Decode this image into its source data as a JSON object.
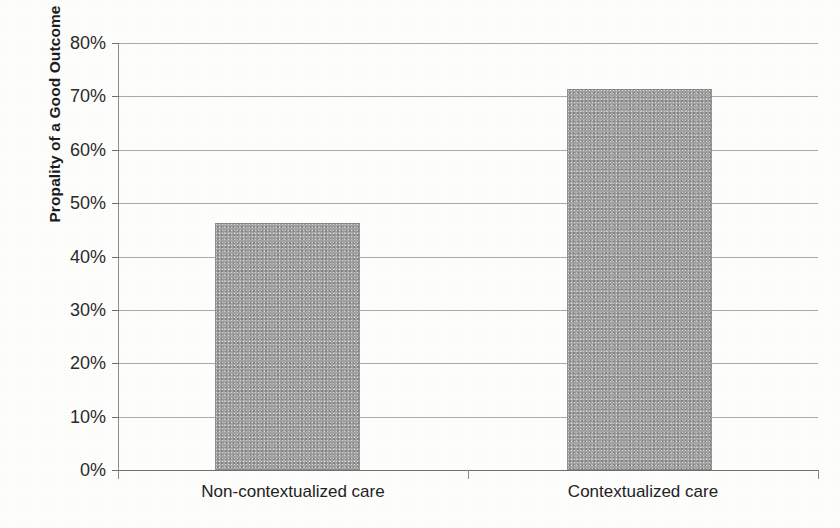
{
  "chart_data": {
    "type": "bar",
    "title": "",
    "xlabel": "",
    "ylabel": "Propality of a Good Outcome",
    "categories": [
      "Non-contextualized care",
      "Contextualized care"
    ],
    "values": [
      46.3,
      71.3
    ],
    "value_unit": "%",
    "ylim": [
      0,
      80
    ],
    "ytick_labels": [
      "80%",
      "70%",
      "60%",
      "50%",
      "40%",
      "30%",
      "20%",
      "10%",
      "0%"
    ],
    "ytick_values": [
      80,
      70,
      60,
      50,
      40,
      30,
      20,
      10,
      0
    ],
    "grid": "horizontal",
    "legend": "none",
    "bar_color": "#a2a2a2",
    "gridline_color": "#a9a9a9",
    "axis_color": "#8a8a8a",
    "text_color": "#222222",
    "background_color": "#fdfdfc"
  }
}
